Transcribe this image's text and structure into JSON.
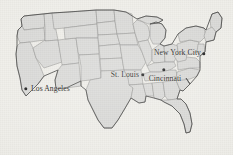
{
  "figure": {
    "name": "united-states-map",
    "width": 233,
    "height": 155
  },
  "colors": {
    "background": "#efeee9",
    "state_fill": "#d9d9d7",
    "state_border": "#8e8e8c",
    "nation_outline": "#4a4a48",
    "marker": "#1c1c1c",
    "label_text": "#121212"
  },
  "cities": [
    {
      "name": "Los Angeles",
      "label": "Los Angeles",
      "marker_x": 26,
      "marker_y": 89,
      "label_x": 31,
      "label_y": 89,
      "anchor": "left"
    },
    {
      "name": "St. Louis",
      "label": "St. Louis",
      "marker_x": 143,
      "marker_y": 75,
      "label_x": 139,
      "label_y": 75,
      "anchor": "right"
    },
    {
      "name": "Cincinnati",
      "label": "Cincinnati",
      "marker_x": 164,
      "marker_y": 70,
      "label_x": 165,
      "label_y": 79,
      "anchor": "mid"
    },
    {
      "name": "New York City",
      "label": "New York City",
      "marker_x": 204,
      "marker_y": 54,
      "label_x": 201,
      "label_y": 53,
      "anchor": "right"
    }
  ]
}
